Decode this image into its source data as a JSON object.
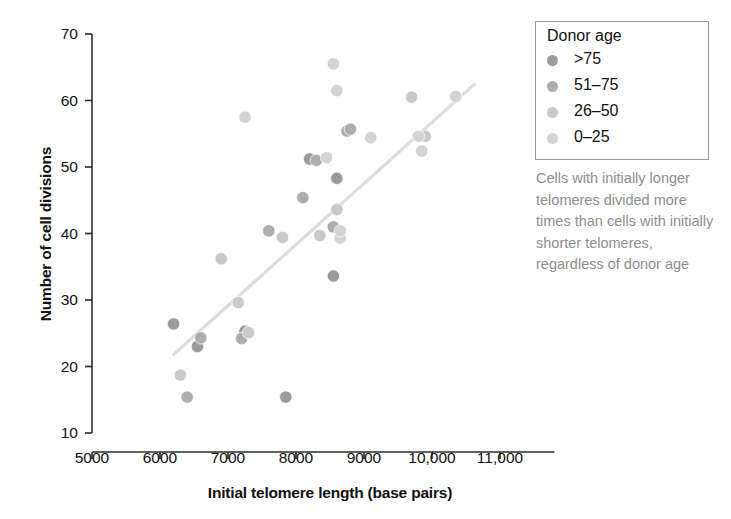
{
  "axes": {
    "x": {
      "label": "Initial telomere length (base pairs)",
      "ticks": [
        "5000",
        "6000",
        "7000",
        "8000",
        "9000",
        "10,000",
        "11,000"
      ],
      "tick_values": [
        5000,
        6000,
        7000,
        8000,
        9000,
        10000,
        11000
      ],
      "min": 5000,
      "max": 11000
    },
    "y": {
      "label": "Number of cell divisions",
      "ticks": [
        "10",
        "20",
        "30",
        "40",
        "50",
        "60",
        "70"
      ],
      "tick_values": [
        10,
        20,
        30,
        40,
        50,
        60,
        70
      ],
      "min": 10,
      "max": 70
    }
  },
  "legend": {
    "title": "Donor age",
    "items": [
      {
        "label": ">75",
        "color": "#9b9b9b"
      },
      {
        "label": "51–75",
        "color": "#adadad"
      },
      {
        "label": "26–50",
        "color": "#c9c9c9"
      },
      {
        "label": "0–25",
        "color": "#d3d3d3"
      }
    ]
  },
  "annotation": {
    "text": "Cells with initially longer telomeres divided more times than cells with initially shorter telomeres, regardless of donor age",
    "color": "#8d8d8d"
  },
  "colors": {
    "axis": "#2b2b2b",
    "text": "#111111",
    "trendline": "#dcdcdc",
    "background": "#ffffff"
  },
  "chart_data": {
    "type": "scatter",
    "title": "",
    "xlabel": "Initial telomere length (base pairs)",
    "ylabel": "Number of cell divisions",
    "xlim": [
      5000,
      11000
    ],
    "ylim": [
      10,
      70
    ],
    "grid": false,
    "legend_position": "top-right",
    "legend_title": "Donor age",
    "series": [
      {
        "name": ">75",
        "color": "#9b9b9b",
        "points": [
          {
            "x": 6200,
            "y": 26.4
          },
          {
            "x": 6550,
            "y": 23.0
          },
          {
            "x": 7250,
            "y": 25.3
          },
          {
            "x": 7850,
            "y": 15.4
          },
          {
            "x": 8200,
            "y": 51.2
          },
          {
            "x": 8550,
            "y": 33.6
          },
          {
            "x": 8600,
            "y": 48.3
          }
        ]
      },
      {
        "name": "51–75",
        "color": "#adadad",
        "points": [
          {
            "x": 6400,
            "y": 15.4
          },
          {
            "x": 6600,
            "y": 24.3
          },
          {
            "x": 7200,
            "y": 24.2
          },
          {
            "x": 7600,
            "y": 40.4
          },
          {
            "x": 8100,
            "y": 45.4
          },
          {
            "x": 8300,
            "y": 51.0
          },
          {
            "x": 8550,
            "y": 41.0
          },
          {
            "x": 8750,
            "y": 55.4
          },
          {
            "x": 8800,
            "y": 55.7
          }
        ]
      },
      {
        "name": "26–50",
        "color": "#c9c9c9",
        "points": [
          {
            "x": 6300,
            "y": 18.7
          },
          {
            "x": 6900,
            "y": 36.2
          },
          {
            "x": 7150,
            "y": 29.6
          },
          {
            "x": 7300,
            "y": 25.1
          },
          {
            "x": 7800,
            "y": 39.4
          },
          {
            "x": 8350,
            "y": 39.7
          },
          {
            "x": 8600,
            "y": 43.6
          },
          {
            "x": 9700,
            "y": 60.5
          },
          {
            "x": 9900,
            "y": 54.6
          }
        ]
      },
      {
        "name": "0–25",
        "color": "#d3d3d3",
        "points": [
          {
            "x": 7250,
            "y": 57.5
          },
          {
            "x": 8450,
            "y": 51.4
          },
          {
            "x": 8550,
            "y": 65.5
          },
          {
            "x": 8600,
            "y": 61.5
          },
          {
            "x": 8650,
            "y": 39.3
          },
          {
            "x": 8650,
            "y": 40.4
          },
          {
            "x": 9100,
            "y": 54.4
          },
          {
            "x": 9800,
            "y": 54.6
          },
          {
            "x": 9850,
            "y": 52.4
          },
          {
            "x": 10350,
            "y": 60.6
          }
        ]
      }
    ],
    "trendline": {
      "x0": 6200,
      "y0": 21.8,
      "x1": 10620,
      "y1": 62.4,
      "color": "#dcdcdc"
    }
  }
}
